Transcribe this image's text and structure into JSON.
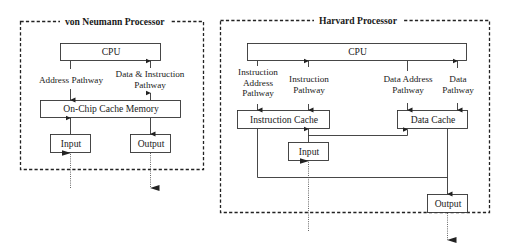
{
  "diagram": {
    "von_neumann": {
      "title": "von Neumann Processor",
      "cpu": "CPU",
      "address_pathway": "Address Pathway",
      "data_instruction_pathway": [
        "Data & Instruction",
        "Pathway"
      ],
      "cache": "On-Chip Cache Memory",
      "input": "Input",
      "output": "Output"
    },
    "harvard": {
      "title": "Harvard Processor",
      "cpu": "CPU",
      "instruction_address_pathway": [
        "Instruction",
        "Address",
        "Pathway"
      ],
      "instruction_pathway": [
        "Instruction",
        "Pathway"
      ],
      "data_address_pathway": [
        "Data Address",
        "Pathway"
      ],
      "data_pathway": [
        "Data",
        "Pathway"
      ],
      "instruction_cache": "Instruction Cache",
      "data_cache": "Data Cache",
      "input": "Input",
      "output": "Output"
    }
  }
}
